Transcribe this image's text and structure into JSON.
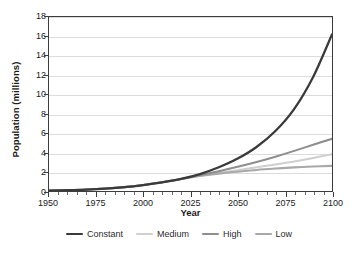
{
  "chart_data": {
    "type": "line",
    "title": "",
    "xlabel": "Year",
    "ylabel": "Population (millions)",
    "xlim": [
      1950,
      2100
    ],
    "ylim": [
      0,
      18
    ],
    "xticks": [
      1950,
      1975,
      2000,
      2025,
      2050,
      2075,
      2100
    ],
    "xtick_labels": [
      "1950",
      "1975",
      "2000",
      "2025",
      "2050",
      "2075",
      "2100"
    ],
    "xtick_minor_step": 5,
    "yticks": [
      0,
      2,
      4,
      6,
      8,
      10,
      12,
      14,
      16,
      18
    ],
    "ytick_labels": [
      "0",
      "2",
      "4",
      "6",
      "8",
      "10",
      "12",
      "14",
      "16",
      "18"
    ],
    "grid": "horizontal",
    "grid_color": "#dcdcdc",
    "legend_position": "below",
    "background": "#ffffff",
    "frame_color": "#3d3d3d",
    "x": [
      1950,
      1960,
      1970,
      1980,
      1990,
      2000,
      2010,
      2020,
      2030,
      2040,
      2050,
      2060,
      2070,
      2080,
      2090,
      2100
    ],
    "series": [
      {
        "name": "Constant",
        "color": "#3a3a3a",
        "width": 2.3,
        "values": [
          0.05,
          0.09,
          0.15,
          0.25,
          0.4,
          0.62,
          0.9,
          1.25,
          1.75,
          2.45,
          3.35,
          4.55,
          6.2,
          8.5,
          11.8,
          16.2
        ]
      },
      {
        "name": "Medium",
        "color": "#cfcfcf",
        "width": 2.1,
        "values": [
          0.05,
          0.09,
          0.15,
          0.25,
          0.4,
          0.62,
          0.9,
          1.25,
          1.6,
          1.9,
          2.15,
          2.45,
          2.75,
          3.05,
          3.42,
          3.8
        ]
      },
      {
        "name": "High",
        "color": "#8e8e8e",
        "width": 2.1,
        "values": [
          0.05,
          0.09,
          0.15,
          0.25,
          0.4,
          0.62,
          0.9,
          1.25,
          1.65,
          2.05,
          2.5,
          3.0,
          3.55,
          4.15,
          4.78,
          5.4
        ]
      },
      {
        "name": "Low",
        "color": "#a8a8a8",
        "width": 2.1,
        "values": [
          0.05,
          0.09,
          0.15,
          0.25,
          0.4,
          0.62,
          0.9,
          1.25,
          1.55,
          1.8,
          2.0,
          2.18,
          2.32,
          2.44,
          2.53,
          2.6
        ]
      }
    ]
  },
  "legend": {
    "items": [
      {
        "label": "Constant",
        "color": "#3a3a3a",
        "width": 2.3
      },
      {
        "label": "Medium",
        "color": "#cfcfcf",
        "width": 2.1
      },
      {
        "label": "High",
        "color": "#8e8e8e",
        "width": 2.1
      },
      {
        "label": "Low",
        "color": "#a8a8a8",
        "width": 2.1
      }
    ]
  }
}
